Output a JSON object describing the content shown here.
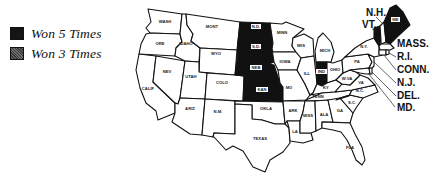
{
  "legend": {
    "items": [
      {
        "label": "Won 5 Times",
        "pattern": "solid",
        "color": "#151515"
      },
      {
        "label": "Won 3 Times",
        "pattern": "stippled",
        "color": "#555555"
      }
    ]
  },
  "map": {
    "states": {
      "wa": "WASH",
      "or": "ORE",
      "ca": "CALIF",
      "id": "IDAHO",
      "nv": "NEV",
      "mt": "MONT",
      "wy": "WYO",
      "ut": "UTAH",
      "az": "ARIZ",
      "co": "COLO",
      "nm": "N.M.",
      "nd": "N.D.",
      "sd": "S.D.",
      "ne": "NEB",
      "ks": "KAN",
      "ok": "OKLA",
      "tx": "TEXAS",
      "mn": "MINN",
      "ia": "IOWA",
      "mo": "MO",
      "ar": "ARK",
      "la": "LA",
      "wi": "WIS",
      "il": "ILL",
      "mi": "MICH",
      "in": "IND",
      "oh": "OHIO",
      "ky": "KY",
      "tn": "TENN",
      "ms": "MISS",
      "al": "ALA",
      "ga": "GA",
      "fl": "FLA",
      "sc": "S.C.",
      "nc": "N.C.",
      "va": "VA",
      "wv": "W.VA",
      "pa": "PA",
      "ny": "N.Y.",
      "me": "ME"
    },
    "callouts": {
      "nh": "N.H.",
      "vt": "VT.",
      "mass": "MASS.",
      "ri": "R.I.",
      "conn": "CONN.",
      "nj": "N.J.",
      "del": "DEL.",
      "md": "MD."
    },
    "won_5_times": [
      "N.D.",
      "S.D.",
      "NEB",
      "KAN",
      "IND",
      "VT.",
      "ME"
    ],
    "won_3_times": []
  }
}
